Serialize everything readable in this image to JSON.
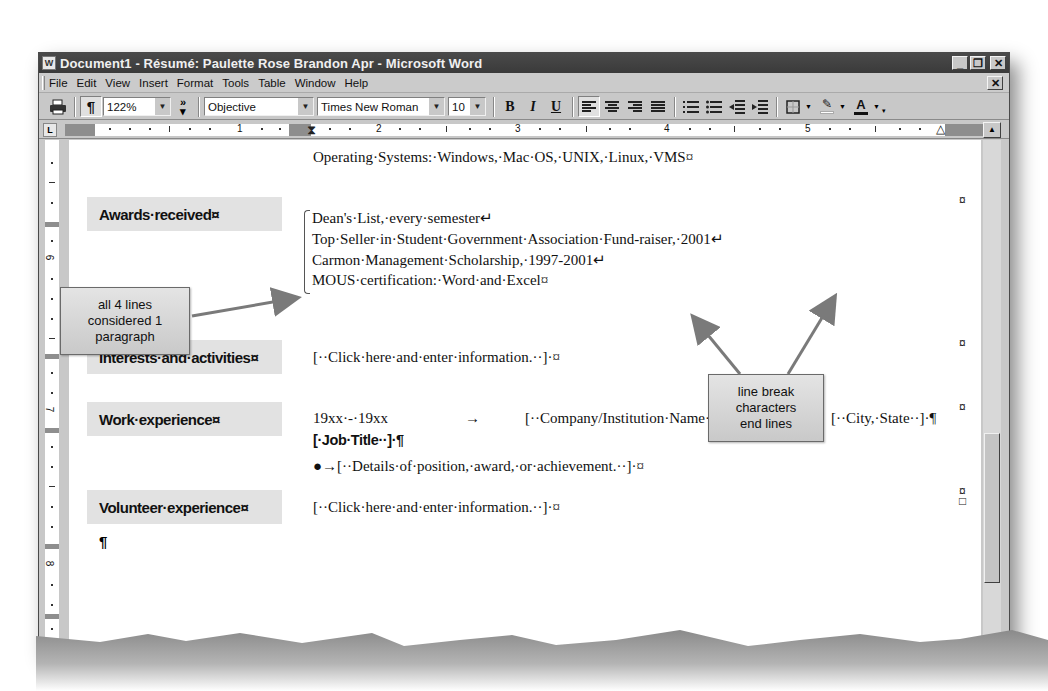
{
  "window": {
    "title": "Document1 - Résumé: Paulette Rose Brandon Apr - Microsoft Word",
    "app_icon": "word-doc-icon",
    "buttons": {
      "minimize": "_",
      "restore": "🗗",
      "close": "✕"
    }
  },
  "menubar": {
    "items": [
      {
        "label": "File",
        "accel": "F"
      },
      {
        "label": "Edit",
        "accel": "E"
      },
      {
        "label": "View",
        "accel": "V"
      },
      {
        "label": "Insert",
        "accel": "I"
      },
      {
        "label": "Format",
        "accel": "o"
      },
      {
        "label": "Tools",
        "accel": "T"
      },
      {
        "label": "Table",
        "accel": "a"
      },
      {
        "label": "Window",
        "accel": "W"
      },
      {
        "label": "Help",
        "accel": "H"
      }
    ],
    "doc_close": "✕"
  },
  "toolbar": {
    "print_icon": "🖶",
    "show_hide_icon": "¶",
    "zoom": "122%",
    "more_buttons": "»",
    "style": "Objective",
    "font": "Times New Roman",
    "font_size": "10",
    "bold": "B",
    "italic": "I",
    "underline": "U",
    "highlight_color": "#ffffff",
    "font_color": "#111111"
  },
  "ruler": {
    "tab_selector": "L",
    "labels": [
      "1",
      "2",
      "3",
      "4",
      "5"
    ],
    "vertical_labels": [
      "6",
      "7",
      "8"
    ]
  },
  "document": {
    "os_line": "Operating·Systems:·Windows,·Mac·OS,·UNIX,·Linux,·VMS¤",
    "sections": [
      {
        "heading": "Awards·received¤",
        "lines": [
          "Dean's·List,·every·semester↵",
          "Top·Seller·in·Student·Government·Association·Fund-raiser,·2001↵",
          "Carmon·Management·Scholarship,·1997-2001↵",
          "MOUS·certification:·Word·and·Excel¤"
        ]
      },
      {
        "heading": "Interests·and·activities¤",
        "lines": [
          "[··Click·here·and·enter·information.··]·¤"
        ]
      },
      {
        "heading": "Work·experience¤",
        "dates": "19xx·-·19xx",
        "tab_arrow": "→",
        "company": "[··Company/Institution·Name··]·",
        "city": "[··City,·State··]·¶",
        "job_title": "[·Job·Title··]·¶",
        "details": "●→[··Details·of·position,·award,·or·achievement.··]·¤"
      },
      {
        "heading": "Volunteer·experience¤",
        "lines": [
          "[··Click·here·and·enter·information.··]·¤"
        ]
      }
    ],
    "final_paragraph_mark": "¶",
    "end_of_cell_mark": "¤"
  },
  "callouts": {
    "paragraph": "all 4 lines considered 1 paragraph",
    "paragraph_lines": [
      "all 4 lines",
      "considered 1",
      "paragraph"
    ],
    "line_break": "line break characters end lines",
    "line_break_lines": [
      "line break",
      "characters",
      "end lines"
    ]
  }
}
